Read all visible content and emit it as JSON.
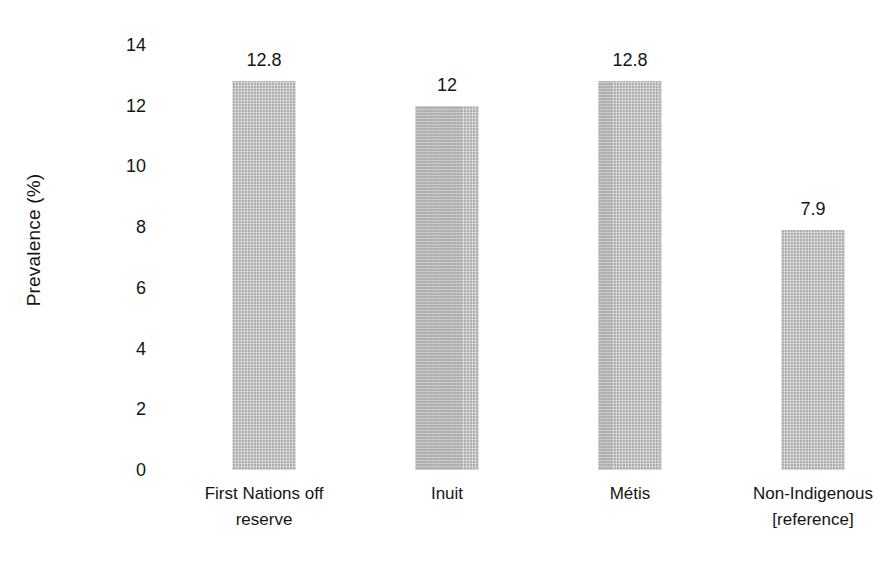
{
  "chart_data": {
    "type": "bar",
    "title": "",
    "subtitle": "",
    "xlabel": "",
    "ylabel": "Prevalence (%)",
    "ylim": [
      0,
      14
    ],
    "ytick_step": 2,
    "yticks": [
      "14",
      "12",
      "10",
      "8",
      "6",
      "4",
      "2",
      "0"
    ],
    "grid": false,
    "legend": null,
    "bar_color": "#bcbcbc",
    "text_color": "#151515",
    "background": "#ffffff",
    "categories": [
      "First Nations off reserve",
      "Inuit",
      "Métis",
      "Non-Indigenous [reference]"
    ],
    "category_lines": [
      [
        "First Nations off",
        "reserve"
      ],
      [
        "Inuit"
      ],
      [
        "Métis"
      ],
      [
        "Non-Indigenous",
        "[reference]"
      ]
    ],
    "values": [
      12.8,
      12,
      12.8,
      7.9
    ],
    "value_labels": [
      "12.8",
      "12",
      "12.8",
      "7.9"
    ]
  }
}
